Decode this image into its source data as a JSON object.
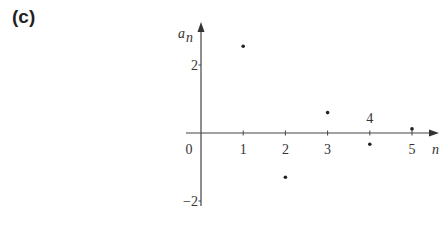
{
  "figure_label": "(c)",
  "chart_data": {
    "type": "scatter",
    "title": "",
    "xlabel": "n",
    "ylabel": "a_n",
    "x": [
      1,
      2,
      3,
      4,
      5
    ],
    "values": [
      2.55,
      -1.3,
      0.6,
      -0.33,
      0.12
    ],
    "xticks": [
      "0",
      "1",
      "2",
      "3",
      "4",
      "5"
    ],
    "yticks": [
      "2",
      "-2"
    ],
    "ylim": [
      -2,
      2.7
    ],
    "xlim": [
      0,
      5.5
    ],
    "grid": false,
    "legend": null
  },
  "axes": {
    "x_label": "n",
    "y_label_main": "a",
    "y_label_sub": "n",
    "origin_label": "0",
    "xtick_labels": [
      "1",
      "2",
      "3",
      "4",
      "5"
    ],
    "ytick_labels": [
      "2",
      "−2"
    ]
  }
}
